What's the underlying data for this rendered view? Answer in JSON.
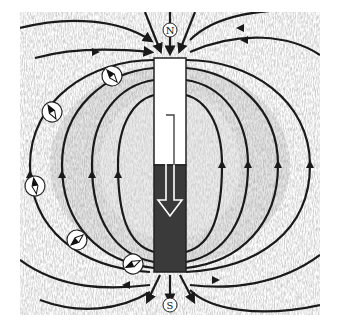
{
  "diagram": {
    "type": "bar-magnet-field-lines",
    "colors": {
      "background": "#ffffff",
      "filings": "#8c8c8c",
      "field_line": "#1a1a1a",
      "magnet_north_half": "#ffffff",
      "magnet_south_half": "#3a3a3a",
      "magnet_outline": "#222222"
    },
    "magnet": {
      "x": 154,
      "y": 58,
      "width": 32,
      "height": 214,
      "split_y": 165
    },
    "pole_labels": {
      "north": "N",
      "south": "S"
    },
    "compasses": [
      {
        "cx": 112,
        "cy": 76,
        "angle": -40
      },
      {
        "cx": 52,
        "cy": 112,
        "angle": -60
      },
      {
        "cx": 35,
        "cy": 185,
        "angle": -95
      },
      {
        "cx": 77,
        "cy": 240,
        "angle": 140
      },
      {
        "cx": 133,
        "cy": 263,
        "angle": 160
      }
    ],
    "internal_arrow_direction": "down"
  }
}
